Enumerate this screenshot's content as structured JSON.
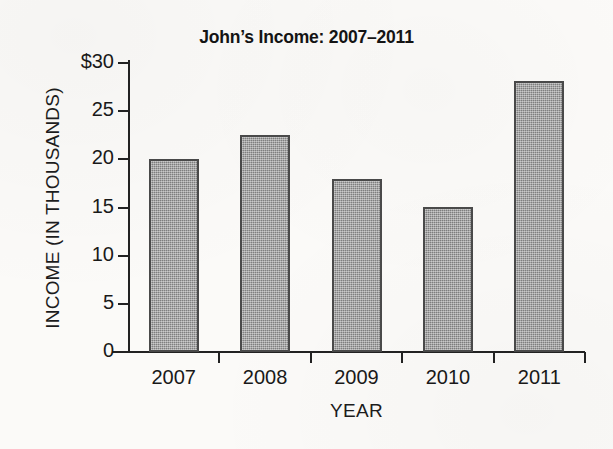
{
  "chart_data": {
    "type": "bar",
    "title": "John’s Income: 2007–2011",
    "xlabel": "YEAR",
    "ylabel": "INCOME  (IN THOUSANDS)",
    "categories": [
      "2007",
      "2008",
      "2009",
      "2010",
      "2011"
    ],
    "values": [
      20,
      22.5,
      18,
      15.1,
      28.1
    ],
    "ylim": [
      0,
      30
    ],
    "ytick_values": [
      30,
      25,
      20,
      15,
      10,
      5,
      0
    ],
    "ytick_labels": [
      "$30",
      "25",
      "20",
      "15",
      "10",
      "5",
      "0"
    ],
    "grid": false,
    "legend": null,
    "bar_color": "#8d8d8d",
    "bar_border_color": "#4a4a4a",
    "axis_color": "#222222",
    "background_color": "#fbfaf8"
  }
}
